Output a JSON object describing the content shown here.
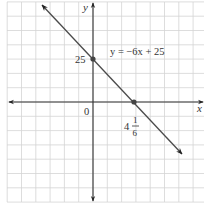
{
  "chart_data": {
    "type": "line",
    "title": "",
    "xlabel": "x",
    "ylabel": "y",
    "grid": true,
    "series": [
      {
        "name": "y = -6x + 25",
        "equation": "y = −6x + 25",
        "slope": -6,
        "intercept": 25,
        "points": [
          {
            "x": 0,
            "y": 25,
            "label": "25"
          },
          {
            "x": 4.1667,
            "y": 0,
            "label": "4 1/6"
          }
        ]
      }
    ],
    "annotations": {
      "origin": "0",
      "y_intercept": "25",
      "x_intercept_whole": "4",
      "x_intercept_num": "1",
      "x_intercept_den": "6",
      "equation_label": "y = −6x + 25"
    },
    "axis_labels": {
      "x": "x",
      "y": "y"
    }
  },
  "colors": {
    "grid": "#d4d4d4",
    "axis": "#333333",
    "line": "#4a4a4a",
    "point": "#444444"
  }
}
